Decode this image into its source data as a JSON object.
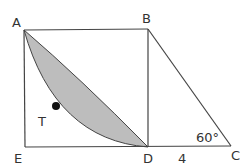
{
  "diagram": {
    "type": "geometry",
    "colors": {
      "line": "#444444",
      "shade": "#bdbdbd",
      "point": "#111111",
      "text": "#333333"
    },
    "points": {
      "A": {
        "label": "A",
        "x": 24,
        "y": 30
      },
      "B": {
        "label": "B",
        "x": 148,
        "y": 29
      },
      "C": {
        "label": "C",
        "x": 231,
        "y": 146
      },
      "D": {
        "label": "D",
        "x": 148,
        "y": 147
      },
      "E": {
        "label": "E",
        "x": 25,
        "y": 147
      },
      "T": {
        "label": "T",
        "x": 56,
        "y": 106
      }
    },
    "annotations": {
      "angle_C": "60°",
      "length_DC": "4"
    }
  }
}
